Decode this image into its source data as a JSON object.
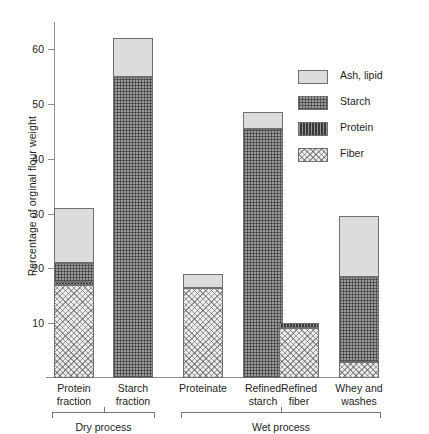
{
  "chart_data": {
    "type": "bar",
    "title": "",
    "subtitle": "",
    "xlabel": "",
    "ylabel": "Percentage of orginal flour weight",
    "stacked": true,
    "grid": false,
    "legend_position": "top-right",
    "ylim": [
      0,
      65
    ],
    "yticks": [
      10,
      20,
      30,
      40,
      50,
      60
    ],
    "ytick_labels": [
      "10",
      "20",
      "30",
      "40",
      "50",
      "60"
    ],
    "categories": [
      "Protein fraction",
      "Starch fraction",
      "Proteinate",
      "Refined starch",
      "Refined fiber",
      "Whey and washes"
    ],
    "category_lines": [
      [
        "Protein",
        "fraction"
      ],
      [
        "Starch",
        "fraction"
      ],
      [
        "Proteinate",
        ""
      ],
      [
        "Refined",
        "starch"
      ],
      [
        "Refined",
        "fiber"
      ],
      [
        "Whey and",
        "washes"
      ]
    ],
    "series": [
      {
        "name": "Fiber",
        "pattern": "fiber",
        "values": [
          17.0,
          0.0,
          16.5,
          0.0,
          9.2,
          3.0
        ]
      },
      {
        "name": "Protein",
        "pattern": "protein",
        "values": [
          0.6,
          0.0,
          0.0,
          0.0,
          0.8,
          0.0
        ]
      },
      {
        "name": "Starch",
        "pattern": "starch",
        "values": [
          3.4,
          55.0,
          0.0,
          45.5,
          0.0,
          15.5
        ]
      },
      {
        "name": "Ash, lipid",
        "pattern": "ash",
        "values": [
          10.0,
          7.0,
          2.5,
          3.0,
          0.0,
          11.0
        ]
      }
    ],
    "totals": [
      31.0,
      62.0,
      19.0,
      48.5,
      10.0,
      29.5
    ],
    "stack_order_bottom_to_top": [
      "Fiber",
      "Protein",
      "Starch",
      "Ash, lipid"
    ],
    "groups": [
      {
        "label": "Dry process",
        "categories": [
          "Protein fraction",
          "Starch fraction"
        ]
      },
      {
        "label": "Wet process",
        "categories": [
          "Proteinate",
          "Refined starch",
          "Refined fiber",
          "Whey and washes"
        ]
      }
    ],
    "legend": [
      {
        "label": "Ash, lipid",
        "pattern": "ash",
        "color": "#dcdcdc"
      },
      {
        "label": "Starch",
        "pattern": "starch",
        "color": "#9a9a9a"
      },
      {
        "label": "Protein",
        "pattern": "protein",
        "color": "#3a3a3a"
      },
      {
        "label": "Fiber",
        "pattern": "fiber",
        "color": "#ececec"
      }
    ]
  }
}
